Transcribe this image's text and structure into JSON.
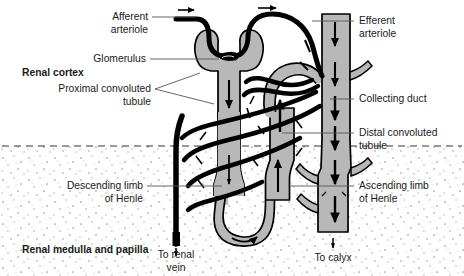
{
  "figure": {
    "type": "anatomical-diagram",
    "width": 464,
    "height": 276
  },
  "colors": {
    "background": "#ffffff",
    "tubule_fill": "#b8b8b8",
    "tubule_stroke": "#000000",
    "vessel_black": "#000000",
    "medulla_stipple": "#9a9a9a",
    "leader_line": "#555555",
    "text": "#1a1a1a",
    "boundary_dash": "#333333"
  },
  "regions": {
    "cortex_label": "Renal cortex",
    "medulla_label": "Renal medulla and papilla"
  },
  "labels": {
    "afferent_arteriole": {
      "line1": "Afferent",
      "line2": "arteriole"
    },
    "glomerulus": {
      "line1": "Glomerulus"
    },
    "proximal_convoluted_tubule": {
      "line1": "Proximal convoluted",
      "line2": "tubule"
    },
    "descending_limb": {
      "line1": "Descending limb",
      "line2": "of Henle"
    },
    "efferent_arteriole": {
      "line1": "Efferent",
      "line2": "arteriole"
    },
    "collecting_duct": {
      "line1": "Collecting duct"
    },
    "distal_convoluted_tubule": {
      "line1": "Distal convoluted",
      "line2": "tubule"
    },
    "ascending_limb": {
      "line1": "Ascending limb",
      "line2": "of Henle"
    }
  },
  "outflow": {
    "renal_vein": {
      "line1": "To renal",
      "line2": "vein"
    },
    "calyx": {
      "line1": "To calyx"
    }
  },
  "flow_arrows": {
    "afferent_inflow": "right-arrow",
    "efferent_outflow": "right-arrow",
    "proximal_tubule_flow": "down-arrow",
    "ascending_limb_flow": "up-arrow",
    "collecting_duct_flow": "down-arrow",
    "renal_vein_flow": "down-arrow",
    "calyx_flow": "down-arrow"
  }
}
